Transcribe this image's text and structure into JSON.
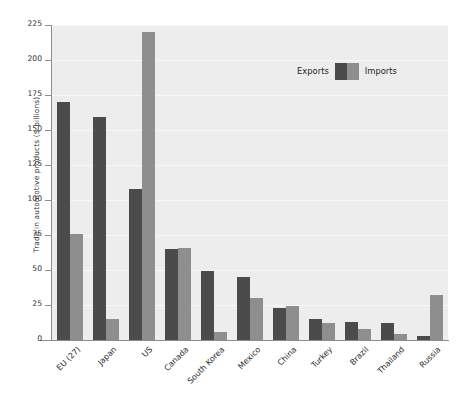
{
  "chart_data": {
    "type": "bar",
    "title": "",
    "xlabel": "",
    "ylabel": "Trade in automotive products ($ billions)",
    "ylim": [
      0,
      225
    ],
    "ytick_step": 25,
    "yticks": [
      0,
      25,
      50,
      75,
      100,
      125,
      150,
      175,
      200,
      225
    ],
    "ytick_labels": [
      "0",
      "25",
      "50",
      "75",
      "100",
      "125",
      "150",
      "175",
      "200",
      "225"
    ],
    "grid": true,
    "legend_position": "upper right",
    "categories": [
      "EU (27)",
      "Japan",
      "US",
      "Canada",
      "South Korea",
      "Mexico",
      "China",
      "Turkey",
      "Brazil",
      "Thailand",
      "Russia"
    ],
    "series": [
      {
        "name": "Exports",
        "color": "#4b4b4b",
        "values": [
          170,
          159,
          108,
          65,
          49,
          45,
          23,
          15,
          13,
          12,
          3
        ]
      },
      {
        "name": "Imports",
        "color": "#8e8e8e",
        "values": [
          76,
          15,
          220,
          66,
          6,
          30,
          24,
          12,
          8,
          4,
          32
        ]
      }
    ]
  },
  "legend": {
    "exports_label": "Exports",
    "imports_label": "Imports"
  },
  "colors": {
    "exports": "#4b4b4b",
    "imports": "#8e8e8e",
    "plot_background": "#ededed",
    "gridline": "#f7f7f7",
    "axis": "#8e8e8e",
    "page_background": "#ffffff"
  }
}
